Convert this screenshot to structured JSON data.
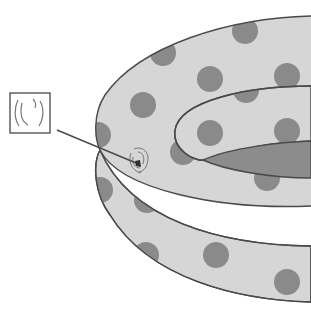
{
  "diagram": {
    "callout": {
      "label": "",
      "icon": "puncture-detail-icon"
    },
    "colors": {
      "background": "#ffffff",
      "vinyl": "#d6d6d6",
      "dots": "#8a8a8a",
      "outline": "#4a4a4a",
      "inner_floor": "#8c8c8c",
      "puncture": "#2e2e2e"
    }
  }
}
